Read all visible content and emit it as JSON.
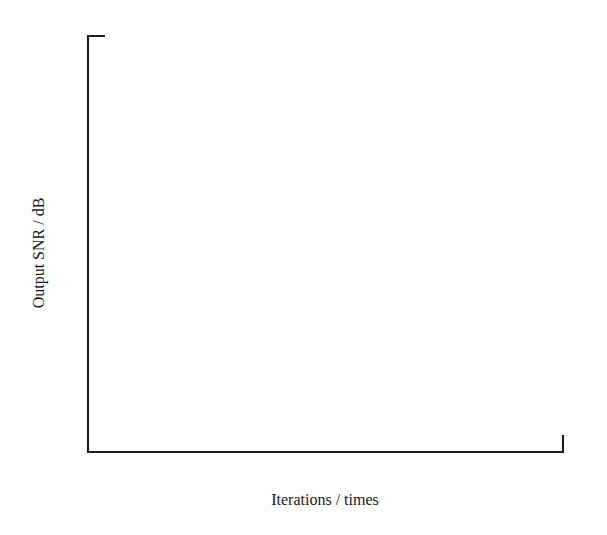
{
  "chart_data": {
    "type": "line",
    "title": "",
    "xlabel": "Iterations / times",
    "ylabel": "Output SNR / dB",
    "xlim": [
      0,
      80
    ],
    "ylim": [
      20,
      70
    ],
    "xticks": [
      "0",
      "10",
      "20",
      "30",
      "40",
      "50",
      "60",
      "70",
      "80"
    ],
    "yticks": [
      "20",
      "30",
      "40",
      "50",
      "60",
      "70"
    ],
    "grid": false,
    "legend_position": "upper-left-inside",
    "series": [
      {
        "name": "traditional method",
        "marker": "square",
        "color": "#1a1a1a",
        "x": [
          0,
          9,
          20,
          30,
          40,
          49,
          60,
          70,
          80
        ],
        "values": [
          26.0,
          31.1,
          36.1,
          38.4,
          41.6,
          45.3,
          47.3,
          52.9,
          55.7
        ],
        "show_marker_at_origin": false
      },
      {
        "name": "The method of this paper",
        "marker": "circle",
        "color": "#1a1a1a",
        "x": [
          0,
          9,
          19,
          30,
          40,
          49,
          60,
          70,
          80
        ],
        "values": [
          34.0,
          40.9,
          44.9,
          48.7,
          51.6,
          53.7,
          56.3,
          61.2,
          63.7
        ],
        "show_marker_at_origin": false
      }
    ]
  },
  "legend": {
    "entries": [
      {
        "label": "traditional method",
        "marker": "square"
      },
      {
        "label": "The method of this paper",
        "marker": "circle"
      }
    ]
  },
  "axes": {
    "x_title": "Iterations / times",
    "y_title": "Output SNR / dB"
  }
}
